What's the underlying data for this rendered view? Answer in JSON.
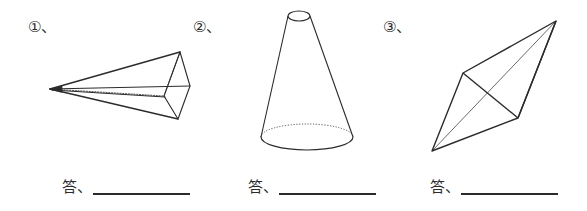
{
  "page": {
    "background_color": "#ffffff",
    "ink_color": "#2b2b2b",
    "width": 587,
    "height": 211
  },
  "items": [
    {
      "marker": "①、",
      "marker_name": "item-number-1",
      "figure": {
        "name": "oblique-pyramid",
        "description": "Oblique pyramid drawn with apex at the left and a quadrilateral base at the right, hidden edges dotted",
        "stroke": "#2b2b2b",
        "apex": [
          50,
          89
        ],
        "base_vertices": [
          [
            180,
            52
          ],
          [
            190,
            86
          ],
          [
            178,
            119
          ],
          [
            164,
            96
          ]
        ],
        "hidden_edges_style": "dotted"
      },
      "answer_label": "答、",
      "answer_value": "",
      "answer_placeholder": ""
    },
    {
      "marker": "②、",
      "marker_name": "item-number-2",
      "figure": {
        "name": "truncated-cone",
        "description": "Truncated cone (frustum) standing upright, small ellipse on top, large ellipse at bottom with dotted hidden back arc",
        "stroke": "#2b2b2b",
        "top_ellipse": {
          "cx": 299,
          "cy": 16,
          "rx": 11,
          "ry": 5
        },
        "bottom_ellipse": {
          "cx": 307,
          "cy": 137,
          "rx": 46,
          "ry": 13
        },
        "hidden_edges_style": "dotted"
      },
      "answer_label": "答、",
      "answer_value": "",
      "answer_placeholder": ""
    },
    {
      "marker": "③、",
      "marker_name": "item-number-3",
      "figure": {
        "name": "tetrahedron",
        "description": "Tetrahedron (triangular pyramid) shown in oblique view with one interior edge thin",
        "stroke": "#2b2b2b",
        "vertices": {
          "top_right": [
            556,
            21
          ],
          "left": [
            463,
            73
          ],
          "right_mid": [
            518,
            118
          ],
          "bottom_left": [
            432,
            151
          ]
        },
        "hidden_edges_style": "thin-solid"
      },
      "answer_label": "答、",
      "answer_value": "",
      "answer_placeholder": ""
    }
  ]
}
